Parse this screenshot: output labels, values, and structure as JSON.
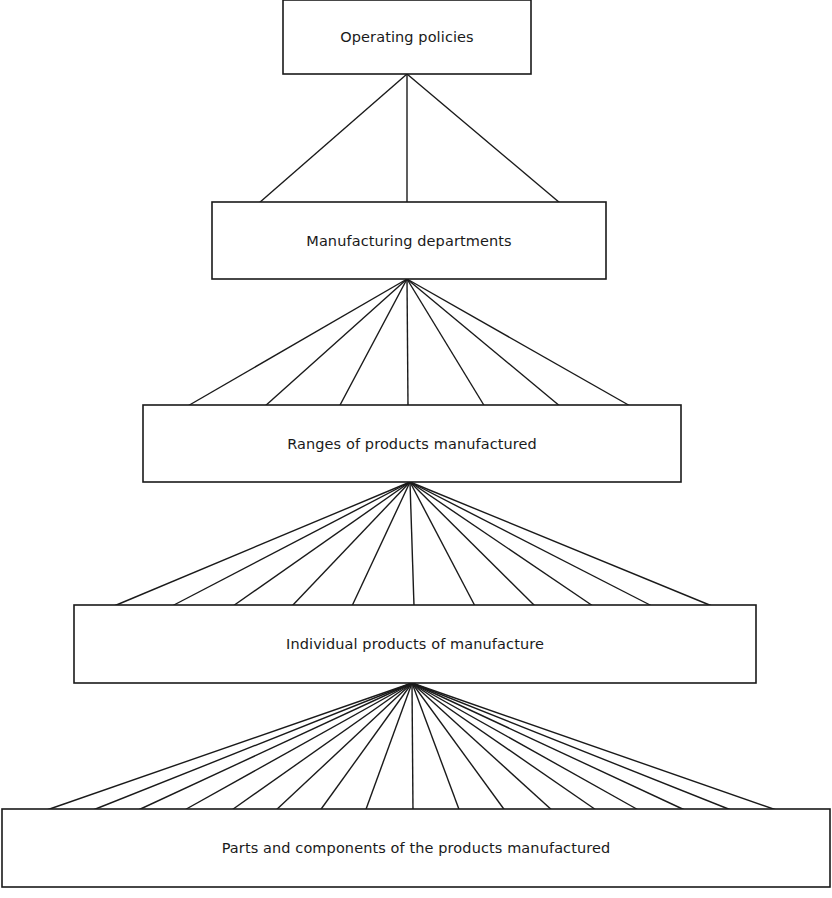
{
  "diagram": {
    "type": "hierarchy",
    "stroke_color": "#1a1a1a",
    "background": "#ffffff",
    "levels": [
      {
        "label": "Operating policies",
        "box": {
          "x": 283,
          "y": 0,
          "w": 248,
          "h": 74
        },
        "apex": {
          "x": 407,
          "y": 74
        },
        "children_count": 3
      },
      {
        "label": "Manufacturing departments",
        "box": {
          "x": 212,
          "y": 202,
          "w": 394,
          "h": 77
        },
        "apex": {
          "x": 407,
          "y": 279
        },
        "children_count": 7
      },
      {
        "label": "Ranges of products manufactured",
        "box": {
          "x": 143,
          "y": 405,
          "w": 538,
          "h": 77
        },
        "apex": {
          "x": 410,
          "y": 482
        },
        "children_count": 11
      },
      {
        "label": "Individual products of manufacture",
        "box": {
          "x": 74,
          "y": 605,
          "w": 682,
          "h": 78
        },
        "apex": {
          "x": 412,
          "y": 683
        },
        "children_count": 17
      },
      {
        "label": "Parts and components of the products manufactured",
        "box": {
          "x": 2,
          "y": 809,
          "w": 828,
          "h": 78
        },
        "apex": null,
        "children_count": 0
      }
    ],
    "connectors": [
      {
        "from_level": 0,
        "apex": [
          407,
          74
        ],
        "y_end": 203,
        "x_ends": [
          259,
          407,
          560
        ]
      },
      {
        "from_level": 1,
        "apex": [
          407,
          279
        ],
        "y_end": 407,
        "x_ends": [
          186,
          264,
          339,
          408,
          485,
          561,
          632
        ]
      },
      {
        "from_level": 2,
        "apex": [
          410,
          482
        ],
        "y_end": 606,
        "x_ends": [
          114,
          172,
          233,
          292,
          352,
          414,
          475,
          535,
          593,
          652,
          712
        ]
      },
      {
        "from_level": 3,
        "apex": [
          412,
          683
        ],
        "y_end": 812,
        "x_ends": [
          41,
          88,
          134,
          181,
          229,
          274,
          319,
          365,
          413,
          460,
          506,
          554,
          599,
          642,
          689,
          736,
          782
        ]
      }
    ]
  }
}
